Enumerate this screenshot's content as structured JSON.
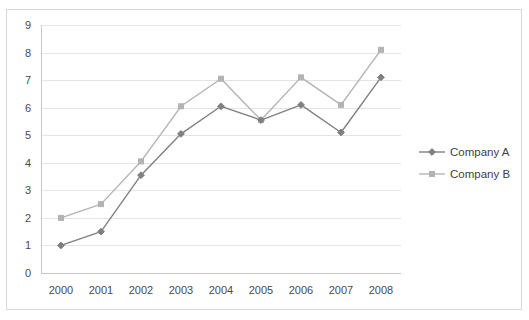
{
  "chart_data": {
    "type": "line",
    "title": "",
    "xlabel": "",
    "ylabel": "",
    "categories": [
      "2000",
      "2001",
      "2002",
      "2003",
      "2004",
      "2005",
      "2006",
      "2007",
      "2008"
    ],
    "x_tick_labels": [
      "2000",
      "2001",
      "2002",
      "2003",
      "2004",
      "2005",
      "2006",
      "2007",
      "2008"
    ],
    "y_tick_labels": [
      "0",
      "1",
      "2",
      "3",
      "4",
      "5",
      "6",
      "7",
      "8",
      "9"
    ],
    "ylim": [
      0,
      9
    ],
    "grid": "horizontal",
    "legend_position": "right",
    "series": [
      {
        "name": "Company A",
        "color": "#808080",
        "marker": "diamond",
        "values": [
          1.0,
          1.5,
          3.55,
          5.05,
          6.05,
          5.55,
          6.1,
          5.1,
          7.1
        ]
      },
      {
        "name": "Company B",
        "color": "#b3b3b3",
        "marker": "square",
        "values": [
          2.0,
          2.5,
          4.05,
          6.05,
          7.05,
          5.55,
          7.1,
          6.1,
          8.1
        ]
      }
    ]
  },
  "legend": {
    "items": [
      {
        "label": "Company A"
      },
      {
        "label": "Company B"
      }
    ]
  },
  "colors": {
    "series_a": "#808080",
    "series_b": "#b3b3b3",
    "gridline": "#e4e4e4",
    "border": "#d8d8d8",
    "text": "#4a4a4a"
  }
}
